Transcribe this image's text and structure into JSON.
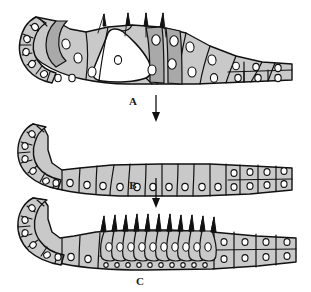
{
  "figure": {
    "panel_count": 3,
    "background_color": "#ffffff",
    "ink_color": "#111111",
    "cell_fill_color": "#c9c9c9",
    "cell_fill_dark": "#a9a9a9",
    "nucleus_fill_color": "#ffffff"
  },
  "labels": {
    "step_a": "A",
    "step_b": "B",
    "step_c": "C"
  },
  "arrows": {
    "a_arrow_name": "downward arrow from panel 1 to panel 2",
    "b_arrow_name": "downward arrow from panel 2 to panel 3"
  },
  "panels": [
    {
      "id": "panel-1",
      "description": "Folded pseudostratified columnar epithelium with a lumen-like cavity and a few apical tufts",
      "apical_tuft_count": 4,
      "has_cavity": true
    },
    {
      "id": "panel-2",
      "description": "Flattened simple columnar epithelium, no apical tufts",
      "apical_tuft_count": 0,
      "has_cavity": false
    },
    {
      "id": "panel-3",
      "description": "Simple columnar epithelium bearing numerous apical tufts on flask-shaped cells",
      "apical_tuft_count": 11,
      "has_cavity": false
    }
  ]
}
